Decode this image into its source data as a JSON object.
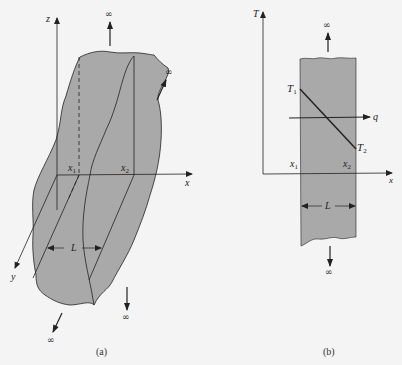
{
  "colors": {
    "background": "#f4f4f4",
    "slab_fill": "#a9a9a9",
    "stroke": "#222222"
  },
  "figure_a": {
    "caption": "(a)",
    "axes": {
      "z": "z",
      "x": "x",
      "y": "y"
    },
    "positions": {
      "x1_main": "x",
      "x1_sub": "1",
      "x2_main": "x",
      "x2_sub": "2"
    },
    "thickness_label": "L",
    "infinity_symbol": "∞"
  },
  "figure_b": {
    "caption": "(b)",
    "axes": {
      "T": "T",
      "x": "x"
    },
    "positions": {
      "x1_main": "x",
      "x1_sub": "1",
      "x2_main": "x",
      "x2_sub": "2"
    },
    "temperatures": {
      "T1_main": "T",
      "T1_sub": "1",
      "T2_main": "T",
      "T2_sub": "2"
    },
    "heat_flux_label": "q",
    "thickness_label": "L",
    "infinity_symbol": "∞"
  }
}
